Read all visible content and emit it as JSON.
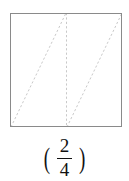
{
  "figure": {
    "type": "partitioned-square",
    "colors": {
      "outline": "#8a8a8a",
      "dashed": "#c9c9c9",
      "background": "#ffffff",
      "text": "#111111"
    },
    "square": {
      "left": 10,
      "top": 13,
      "right": 122,
      "bottom": 127
    },
    "dashed_lines": [
      {
        "name": "vertical-midline",
        "x1": 66,
        "y1": 13,
        "x2": 66,
        "y2": 127
      },
      {
        "name": "diagonal-left",
        "x1": 11,
        "y1": 127,
        "x2": 66,
        "y2": 13
      },
      {
        "name": "diagonal-right",
        "x1": 67,
        "y1": 127,
        "x2": 122,
        "y2": 13
      }
    ]
  },
  "caption": {
    "open_paren": "(",
    "close_paren": ")",
    "fraction": {
      "numerator": "2",
      "denominator": "4"
    }
  }
}
